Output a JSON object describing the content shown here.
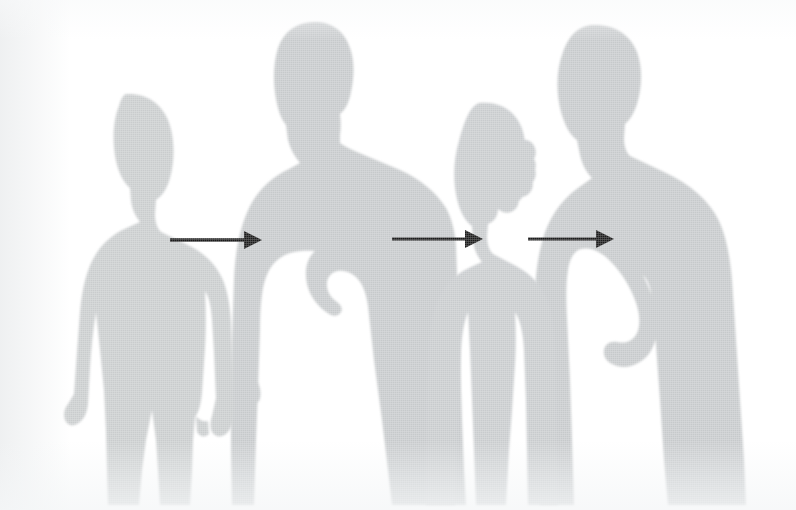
{
  "image": {
    "title": "Four human silhouettes with three connecting arrows",
    "width": 796,
    "height": 510,
    "background_color": "#ffffff",
    "silhouette_color": "#c6c9cb",
    "silhouette_color_light": "#d2d5d7",
    "arrow_color": "#1a1a1a",
    "alt_text": "Four grey human silhouettes standing side by side on a white background, linked left to right by three black arrows"
  },
  "figures": [
    {
      "id": "figure-1",
      "name": "silhouette-woman-left",
      "label": "Woman, left, arms at sides",
      "order": 1,
      "fill": "#c9cccd"
    },
    {
      "id": "figure-2",
      "name": "silhouette-man-tall",
      "label": "Tall man, second from left, hands near hips",
      "order": 2,
      "fill": "#c6c9cb"
    },
    {
      "id": "figure-3",
      "name": "silhouette-woman-curly",
      "label": "Woman with curly hair, third from left",
      "order": 3,
      "fill": "#c8cbcd"
    },
    {
      "id": "figure-4",
      "name": "silhouette-man-right",
      "label": "Man, right, arm akimbo with hand on hip",
      "order": 4,
      "fill": "#c6c9cb"
    }
  ],
  "arrows": [
    {
      "id": "arrow-1",
      "name": "arrow-figure1-to-figure2",
      "label": "Arrow from figure 1 to figure 2",
      "from": "figure-1",
      "to": "figure-2",
      "direction": "right",
      "x_start": 170,
      "x_end": 262,
      "y": 240,
      "color": "#1a1a1a"
    },
    {
      "id": "arrow-2",
      "name": "arrow-figure2-to-figure3",
      "label": "Arrow from figure 2 to figure 3",
      "from": "figure-2",
      "to": "figure-3",
      "direction": "right",
      "x_start": 392,
      "x_end": 483,
      "y": 239,
      "color": "#1a1a1a"
    },
    {
      "id": "arrow-3",
      "name": "arrow-figure3-to-figure4",
      "label": "Arrow from figure 3 to figure 4",
      "from": "figure-3",
      "to": "figure-4",
      "direction": "right",
      "x_start": 528,
      "x_end": 614,
      "y": 239,
      "color": "#1a1a1a"
    }
  ],
  "captions": {
    "visible_text": ""
  }
}
